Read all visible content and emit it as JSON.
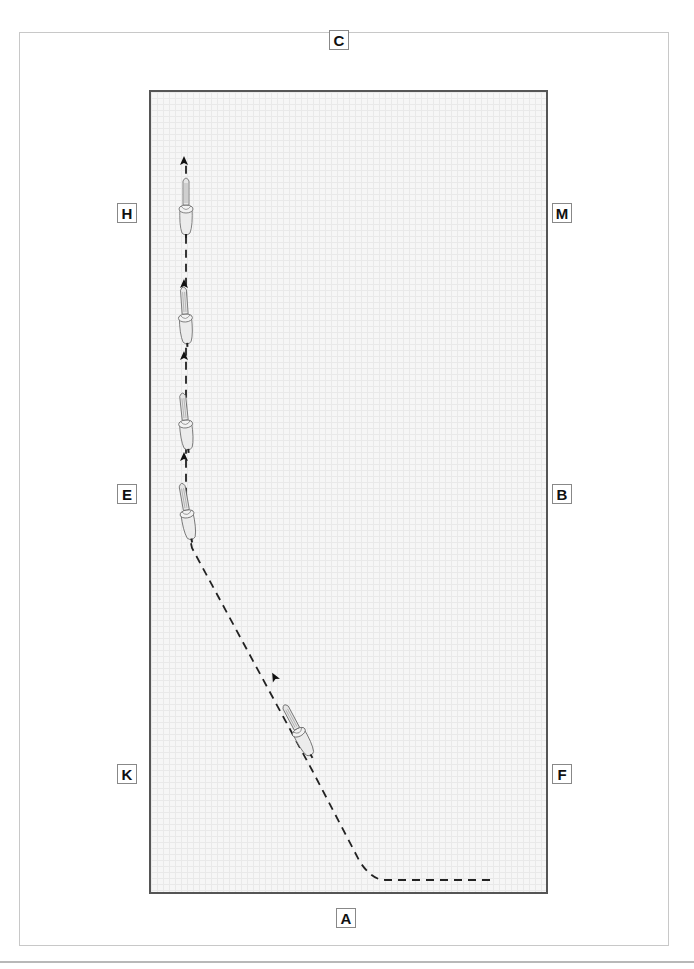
{
  "diagram": {
    "type": "dressage-arena-figure",
    "arena_letters": {
      "top": "C",
      "bottom": "A",
      "left": [
        "H",
        "E",
        "K"
      ],
      "right": [
        "M",
        "B",
        "F"
      ]
    },
    "markers": [
      {
        "id": "C",
        "label": "C",
        "x": 339,
        "y": 32
      },
      {
        "id": "H",
        "label": "H",
        "x": 117,
        "y": 203
      },
      {
        "id": "M",
        "label": "M",
        "x": 553,
        "y": 203
      },
      {
        "id": "E",
        "label": "E",
        "x": 117,
        "y": 484
      },
      {
        "id": "B",
        "label": "B",
        "x": 553,
        "y": 484
      },
      {
        "id": "K",
        "label": "K",
        "x": 117,
        "y": 764
      },
      {
        "id": "F",
        "label": "F",
        "x": 553,
        "y": 764
      },
      {
        "id": "A",
        "label": "A",
        "x": 339,
        "y": 908
      }
    ],
    "path": {
      "style": "dashed",
      "color": "#222222",
      "description": "Track enters along the A end from the right, turns up diagonally toward E, then continues straight along the left track toward H"
    },
    "horses": [
      {
        "id": "horse-1",
        "x": 186,
        "y": 210,
        "angle": 0
      },
      {
        "id": "horse-2",
        "x": 185,
        "y": 318,
        "angle": -4
      },
      {
        "id": "horse-3",
        "x": 185,
        "y": 424,
        "angle": -6
      },
      {
        "id": "horse-4",
        "x": 186,
        "y": 514,
        "angle": -10
      },
      {
        "id": "horse-5",
        "x": 296,
        "y": 733,
        "angle": -28
      }
    ],
    "arrows": [
      {
        "x": 184,
        "y": 165,
        "angle": 0
      },
      {
        "x": 184,
        "y": 285,
        "angle": 0
      },
      {
        "x": 184,
        "y": 357,
        "angle": 0
      },
      {
        "x": 184,
        "y": 457,
        "angle": 0
      },
      {
        "x": 274,
        "y": 678,
        "angle": -28
      }
    ]
  }
}
